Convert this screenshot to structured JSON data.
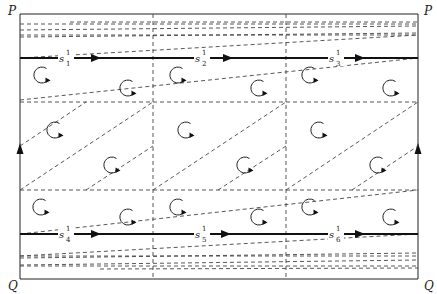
{
  "diagram": {
    "corner_labels": {
      "top_left": "P",
      "top_right": "P",
      "bottom_left": "Q",
      "bottom_right": "Q"
    },
    "segments_top": [
      {
        "base": "s",
        "sup": "1",
        "sub": "1"
      },
      {
        "base": "s",
        "sup": "1",
        "sub": "2"
      },
      {
        "base": "s",
        "sup": "1",
        "sub": "3"
      }
    ],
    "segments_bottom": [
      {
        "base": "s",
        "sup": "1",
        "sub": "4"
      },
      {
        "base": "s",
        "sup": "1",
        "sub": "5"
      },
      {
        "base": "s",
        "sup": "1",
        "sub": "6"
      }
    ],
    "rotation_symbol": "counterclockwise-arrow",
    "colors": {
      "line": "#222222",
      "dashed": "#444444",
      "background": "#ffffff"
    }
  }
}
